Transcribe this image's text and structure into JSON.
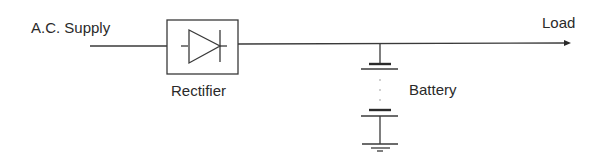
{
  "diagram": {
    "type": "block-circuit",
    "labels": {
      "input": "A.C. Supply",
      "rectifier": "Rectifier",
      "output": "Load",
      "battery": "Battery"
    },
    "components": [
      {
        "id": "ac-supply",
        "kind": "input",
        "label": "A.C. Supply"
      },
      {
        "id": "rectifier",
        "kind": "box-with-diode",
        "label": "Rectifier"
      },
      {
        "id": "battery",
        "kind": "multi-cell-battery",
        "label": "Battery",
        "connected_to": "output-line"
      },
      {
        "id": "ground",
        "kind": "ground-symbol"
      },
      {
        "id": "load",
        "kind": "output-arrow",
        "label": "Load"
      }
    ],
    "connections": [
      {
        "from": "ac-supply",
        "to": "rectifier"
      },
      {
        "from": "rectifier",
        "to": "load"
      },
      {
        "from": "output-line",
        "to": "battery"
      },
      {
        "from": "battery",
        "to": "ground"
      }
    ],
    "colors": {
      "line": "#3a3a3a",
      "text": "#2a2a2a",
      "background": "#ffffff"
    }
  }
}
